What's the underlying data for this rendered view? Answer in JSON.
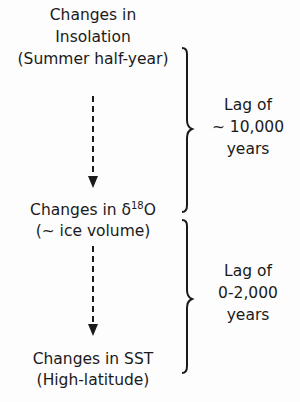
{
  "nodes": [
    {
      "lines": [
        "Changes in",
        "Insolation",
        "(Summer half-year)"
      ]
    },
    {
      "line1_prefix": "Changes in ",
      "delta": "δ",
      "superscript": "18",
      "element": "O",
      "line2": "(~ ice volume)"
    },
    {
      "lines": [
        "Changes in SST",
        "(High-latitude)"
      ]
    }
  ],
  "lags": [
    {
      "lines": [
        "Lag of",
        "~ 10,000",
        "years"
      ]
    },
    {
      "lines": [
        "Lag of",
        "0-2,000",
        "years"
      ]
    }
  ],
  "arrows": [
    {
      "from": "insolation",
      "to": "delta18O",
      "style": "dashed"
    },
    {
      "from": "delta18O",
      "to": "sst",
      "style": "dashed"
    }
  ]
}
